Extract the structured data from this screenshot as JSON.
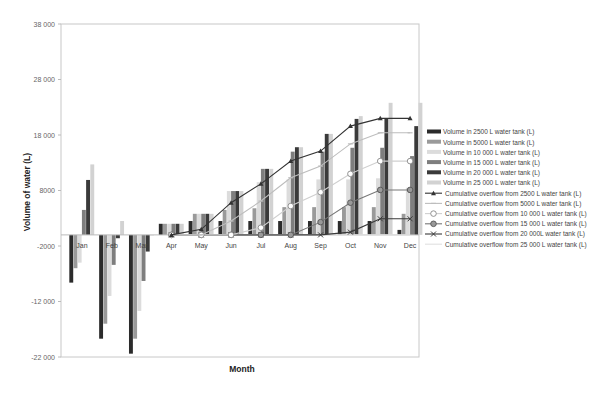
{
  "chart_data": {
    "type": "bar",
    "title": "",
    "xlabel": "Month",
    "ylabel": "Volume of water (L)",
    "ylim": [
      -22000,
      38000
    ],
    "yticks": [
      38000,
      28000,
      18000,
      8000,
      -2000,
      -12000,
      -22000
    ],
    "ytick_labels": [
      "38 000",
      "28 000",
      "18 000",
      "8000",
      "-2000",
      "-12 000",
      "-22 000"
    ],
    "grid": false,
    "legend_position": "right",
    "categories": [
      "Jan",
      "Feb",
      "Mar",
      "Apr",
      "May",
      "Jun",
      "Jul",
      "Aug",
      "Sep",
      "Oct",
      "Nov",
      "Dec"
    ],
    "series": [
      {
        "name": "Volume in 2500 L water tank (L)",
        "kind": "bar",
        "color": "#2b2b2b",
        "values": [
          -8600,
          -18700,
          -21400,
          2000,
          2500,
          2500,
          2500,
          2500,
          2500,
          2500,
          2500,
          900
        ]
      },
      {
        "name": "Volume in 5000 L water tank (L)",
        "kind": "bar",
        "color": "#9a9a9a",
        "values": [
          -6000,
          -16000,
          -18700,
          2000,
          3800,
          4500,
          4800,
          5000,
          5000,
          5000,
          5000,
          3800
        ]
      },
      {
        "name": "Volume in 10 000 L water tank (L)",
        "kind": "bar",
        "color": "#dcdcdc",
        "values": [
          -5000,
          -11000,
          -13700,
          2000,
          3800,
          7900,
          9500,
          10000,
          10000,
          10000,
          10200,
          8500
        ]
      },
      {
        "name": "Volume in 15 000 L water tank (L)",
        "kind": "bar",
        "color": "#7e7e7e",
        "values": [
          4500,
          -5400,
          -8300,
          2000,
          3800,
          7900,
          11900,
          15000,
          15000,
          15700,
          15700,
          14200
        ]
      },
      {
        "name": "Volume in 20 000 L water tank (L)",
        "kind": "bar",
        "color": "#3a3a3a",
        "values": [
          9900,
          -600,
          -3000,
          2000,
          3800,
          7900,
          11900,
          15800,
          18200,
          20900,
          21000,
          19600
        ]
      },
      {
        "name": "Volume in 25 000 L water tank (L)",
        "kind": "bar",
        "color": "#d2d2d2",
        "values": [
          12700,
          2500,
          0,
          2000,
          3800,
          7900,
          11900,
          15800,
          18200,
          21400,
          23800,
          23800
        ]
      },
      {
        "name": "Cumulative overflow from 2500 L water tank (L)",
        "kind": "line",
        "marker": "triangle",
        "color": "#333333",
        "values": [
          null,
          null,
          null,
          0,
          1000,
          5800,
          9200,
          13300,
          15100,
          19600,
          21000,
          21000
        ]
      },
      {
        "name": "Cumulative overflow from 5000 L water tank (L)",
        "kind": "line",
        "marker": "dash",
        "color": "#bdbdbd",
        "values": [
          null,
          null,
          null,
          0,
          0,
          2500,
          6100,
          10300,
          12400,
          16400,
          18400,
          18400
        ]
      },
      {
        "name": "Cumulative overflow from 10 000 L water tank (L)",
        "kind": "line",
        "marker": "open-circle",
        "color": "#cfcfcf",
        "values": [
          null,
          null,
          null,
          0,
          0,
          0,
          1300,
          5200,
          7700,
          11000,
          13300,
          13300
        ]
      },
      {
        "name": "Cumulative overflow from 15 000 L water tank (L)",
        "kind": "line",
        "marker": "filled-circle",
        "color": "#777777",
        "values": [
          null,
          null,
          null,
          0,
          0,
          0,
          0,
          0,
          2300,
          5800,
          8100,
          8100
        ]
      },
      {
        "name": "Cumulative overflow from 20 000L water tank (L)",
        "kind": "line",
        "marker": "cross",
        "color": "#3a3a3a",
        "values": [
          null,
          null,
          null,
          0,
          0,
          0,
          0,
          0,
          0,
          500,
          2900,
          2900
        ]
      },
      {
        "name": "Cumulative overflow from 25 000 L water tank (L)",
        "kind": "line",
        "marker": "none",
        "color": "#e0e0e0",
        "values": [
          null,
          null,
          null,
          0,
          0,
          0,
          0,
          0,
          0,
          0,
          0,
          0
        ]
      }
    ]
  }
}
